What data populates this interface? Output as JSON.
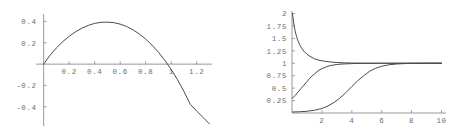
{
  "figure": {
    "panel_count": 2,
    "background_color": "#ffffff",
    "axis_color": "#8c8c8c",
    "curve_color": "#4a4a4a",
    "label_color": "#6e6e6e"
  },
  "chart_data": [
    {
      "id": "left-plot",
      "type": "line",
      "title": "",
      "xlabel": "",
      "ylabel": "",
      "grid": false,
      "legend": "none",
      "axes_style": "crossed-at-origin",
      "xlim": [
        -0.06,
        1.32
      ],
      "ylim": [
        -0.58,
        0.47
      ],
      "xticks": [
        0.2,
        0.4,
        0.6,
        0.8,
        1,
        1.2
      ],
      "xtick_labels": [
        "0.2",
        "0.4",
        "0.6",
        "0.8",
        "1",
        "1.2"
      ],
      "yticks": [
        -0.4,
        -0.2,
        0.2,
        0.4
      ],
      "ytick_labels": [
        "-0.4",
        "-0.2",
        "0.2",
        "0.4"
      ],
      "series": [
        {
          "name": "curve-1",
          "x": [
            0.0,
            0.05,
            0.1,
            0.15,
            0.2,
            0.25,
            0.3,
            0.35,
            0.4,
            0.45,
            0.5,
            0.55,
            0.6,
            0.65,
            0.7,
            0.75,
            0.8,
            0.85,
            0.9,
            0.95,
            1.0,
            1.05,
            1.1,
            1.15,
            1.2,
            1.25,
            1.3
          ],
          "y": [
            0.0,
            0.083,
            0.152,
            0.211,
            0.261,
            0.303,
            0.337,
            0.363,
            0.382,
            0.392,
            0.394,
            0.389,
            0.375,
            0.353,
            0.322,
            0.283,
            0.235,
            0.178,
            0.112,
            0.036,
            -0.05,
            -0.147,
            -0.256,
            -0.377,
            -0.44,
            -0.5,
            -0.56
          ]
        }
      ]
    },
    {
      "id": "right-plot",
      "type": "line",
      "title": "",
      "xlabel": "",
      "ylabel": "",
      "grid": false,
      "legend": "none",
      "axes_style": "left-and-bottom",
      "xlim": [
        0,
        10.3
      ],
      "ylim": [
        0,
        2.05
      ],
      "xticks": [
        2,
        4,
        6,
        8,
        10
      ],
      "xtick_labels": [
        "2",
        "4",
        "6",
        "8",
        "10"
      ],
      "yticks": [
        0.25,
        0.5,
        0.75,
        1,
        1.25,
        1.5,
        1.75,
        2
      ],
      "ytick_labels": [
        "0.25",
        "0.5",
        "0.75",
        "1",
        "1.25",
        "1.5",
        "1.75",
        "2"
      ],
      "asymptote": 1,
      "series": [
        {
          "name": "decaying-curve",
          "x": [
            0.03,
            0.1,
            0.2,
            0.3,
            0.4,
            0.5,
            0.65,
            0.8,
            1.0,
            1.2,
            1.5,
            1.8,
            2.2,
            2.6,
            3.0,
            3.5,
            4.0,
            5.0,
            6.0,
            7.0,
            8.0,
            9.0,
            10.0
          ],
          "y": [
            2.0,
            1.83,
            1.66,
            1.54,
            1.45,
            1.38,
            1.3,
            1.24,
            1.18,
            1.14,
            1.09,
            1.06,
            1.04,
            1.025,
            1.015,
            1.008,
            1.004,
            1.001,
            1.0,
            1.0,
            1.0,
            1.0,
            1.0
          ]
        },
        {
          "name": "mid-rising-curve",
          "x": [
            0.03,
            0.2,
            0.4,
            0.6,
            0.8,
            1.0,
            1.2,
            1.4,
            1.6,
            1.8,
            2.0,
            2.3,
            2.6,
            3.0,
            3.4,
            4.0,
            5.0,
            6.0,
            7.0,
            8.0,
            9.0,
            10.0
          ],
          "y": [
            0.3,
            0.35,
            0.42,
            0.49,
            0.56,
            0.63,
            0.7,
            0.76,
            0.81,
            0.86,
            0.89,
            0.93,
            0.955,
            0.975,
            0.985,
            0.993,
            0.998,
            1.0,
            1.0,
            1.0,
            1.0,
            1.0
          ]
        },
        {
          "name": "late-rising-curve",
          "x": [
            0.03,
            0.5,
            1.0,
            1.5,
            2.0,
            2.4,
            2.8,
            3.2,
            3.6,
            4.0,
            4.4,
            4.8,
            5.2,
            5.6,
            6.0,
            6.5,
            7.0,
            7.5,
            8.0,
            9.0,
            10.0
          ],
          "y": [
            0.02,
            0.025,
            0.035,
            0.055,
            0.09,
            0.14,
            0.21,
            0.3,
            0.41,
            0.53,
            0.65,
            0.75,
            0.84,
            0.9,
            0.94,
            0.97,
            0.985,
            0.993,
            0.997,
            1.0,
            1.0
          ]
        }
      ]
    }
  ]
}
